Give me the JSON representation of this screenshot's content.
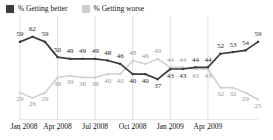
{
  "legend": {
    "items": [
      {
        "label": "% Getting better",
        "color": "#3b3b3b",
        "key": "better"
      },
      {
        "label": "% Getting worse",
        "color": "#cfcfcf",
        "key": "worse"
      }
    ]
  },
  "axis": {
    "tick_labels": [
      "Jan 2008",
      "Apr 2008",
      "Jul 2008",
      "Oct 2008",
      "Jan 2009",
      "Apr 2009"
    ]
  },
  "chart_data": {
    "type": "line",
    "title": "",
    "subtitle": "",
    "xlabel": "",
    "ylabel": "",
    "ylim": [
      20,
      66
    ],
    "grid": true,
    "grid_axis": "x",
    "legend_position": "top-left",
    "x": [
      "Jan 2008",
      "Feb 2008",
      "Mar 2008",
      "Apr 2008",
      "May 2008",
      "Jun 2008",
      "Jul 2008",
      "Aug 2008",
      "Sep 2008",
      "Oct 2008",
      "Nov 2008",
      "Dec 2008",
      "Jan 2009",
      "Feb 2009",
      "Mar 2009",
      "Apr 2009",
      "May 2009",
      "Jun 2009",
      "Jul 2009",
      "Aug 2009"
    ],
    "tick_positions": [
      0,
      3,
      6,
      9,
      12,
      15
    ],
    "series": [
      {
        "name": "% Getting better",
        "color": "#3b3b3b",
        "values": [
          59,
          62,
          59,
          50,
          49,
          49,
          49,
          48,
          46,
          40,
          40,
          37,
          43,
          43,
          44,
          44,
          52,
          53,
          54,
          59
        ],
        "label_side": [
          "above",
          "above",
          "above",
          "above",
          "above",
          "above",
          "above",
          "above",
          "above",
          "below",
          "below",
          "below",
          "below",
          "below",
          "above",
          "above",
          "above",
          "above",
          "above",
          "above"
        ]
      },
      {
        "name": "% Getting worse",
        "color": "#cfcfcf",
        "values": [
          29,
          26,
          29,
          38,
          39,
          38,
          38,
          40,
          40,
          48,
          46,
          49,
          44,
          44,
          43,
          43,
          32,
          32,
          29,
          25
        ],
        "label_side": [
          "below",
          "below",
          "below",
          "below",
          "below",
          "below",
          "below",
          "below",
          "below",
          "above",
          "above",
          "above",
          "above",
          "above",
          "below",
          "below",
          "below",
          "below",
          "below",
          "below"
        ]
      }
    ]
  }
}
